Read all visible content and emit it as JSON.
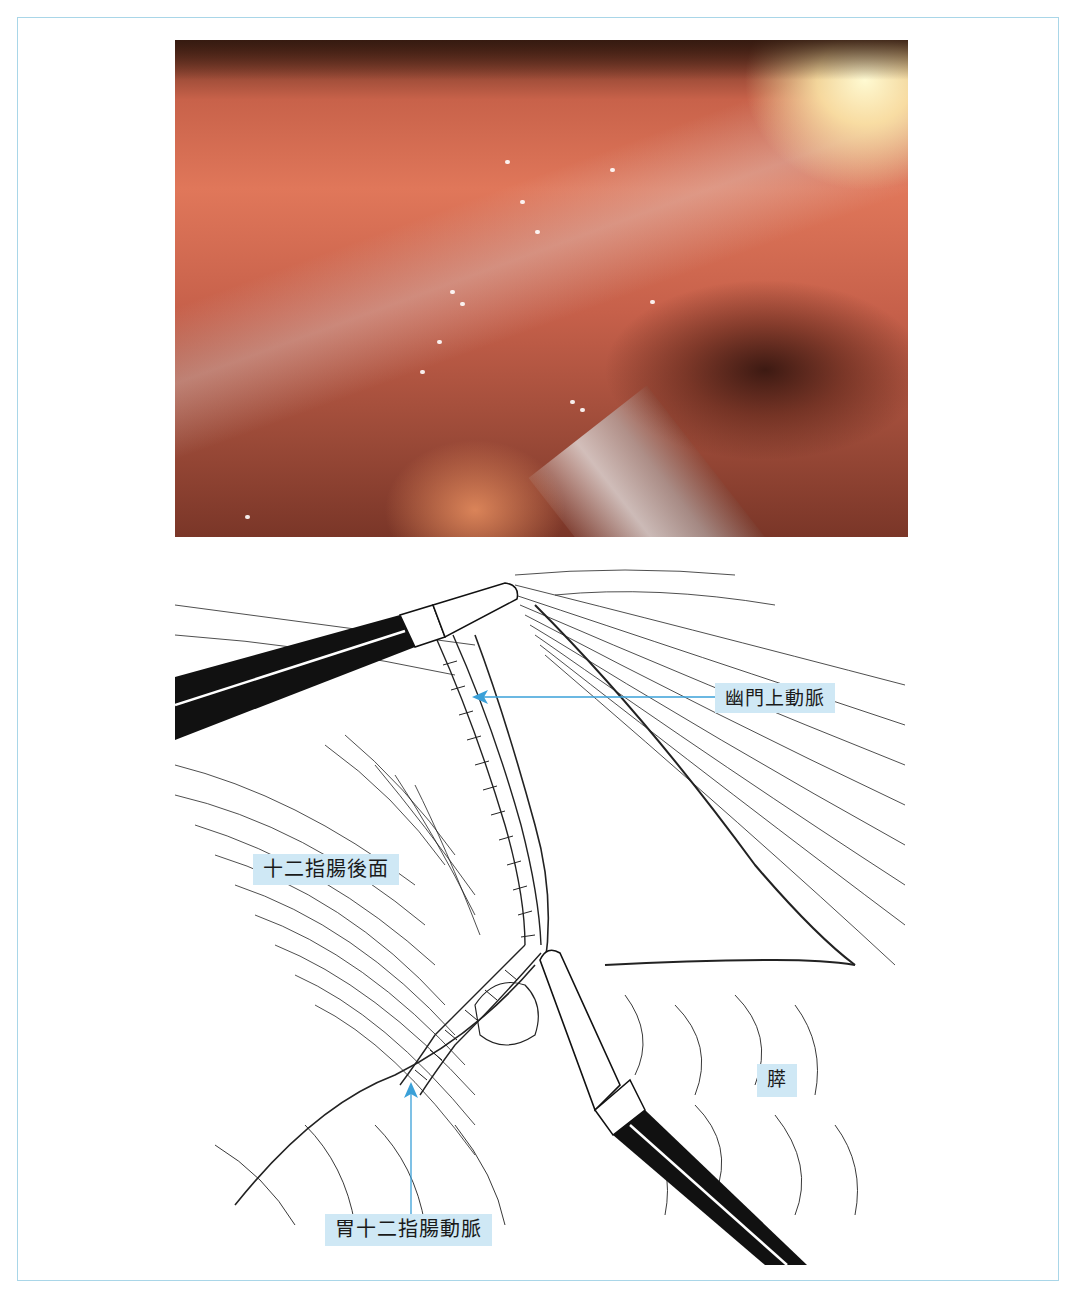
{
  "figure": {
    "photo": {
      "alt": "laparoscopic view",
      "icon": "endoscopic-photo"
    },
    "illustration": {
      "icon": "surgical-line-drawing"
    },
    "labels": {
      "suprapyloric_artery": "幽門上動脈",
      "posterior_duodenum": "十二指腸後面",
      "gastroduodenal_artery": "胃十二指腸動脈",
      "pancreas": "膵"
    },
    "colors": {
      "label_background": "#cfe8f5",
      "arrow": "#3aa0d8",
      "frame_border": "#a9d6e8"
    }
  }
}
